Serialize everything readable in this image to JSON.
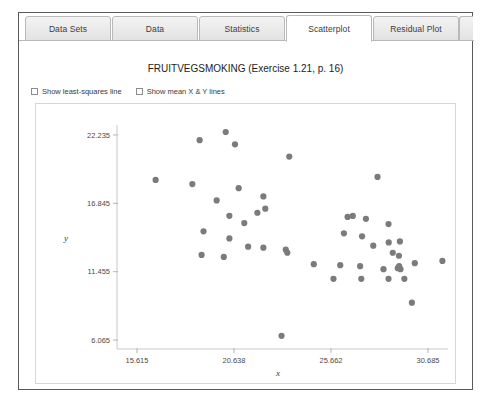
{
  "window": {
    "title": ""
  },
  "tabs": [
    {
      "label": "Data Sets",
      "active": false
    },
    {
      "label": "Data",
      "active": false
    },
    {
      "label": "Statistics",
      "active": false
    },
    {
      "label": "Scatterplot",
      "active": true
    },
    {
      "label": "Residual Plot",
      "active": false
    }
  ],
  "chart_title": "FRUITVEGSMOKING (Exercise 1.21, p. 16)",
  "options": [
    {
      "label": "Show least-squares line",
      "checked": false
    },
    {
      "label": "Show mean X & Y lines",
      "checked": false
    }
  ],
  "chart_data": {
    "type": "scatter",
    "title": "FRUITVEGSMOKING (Exercise 1.21, p. 16)",
    "xlabel": "x",
    "ylabel": "y",
    "xlim": [
      14.58,
      31.72
    ],
    "ylim": [
      5.36,
      23.02
    ],
    "xticks": [
      "15.615",
      "20.638",
      "25.662",
      "30.685"
    ],
    "yticks": [
      "22.235",
      "16.845",
      "11.455",
      "6.065"
    ],
    "xtick_values": [
      15.615,
      20.638,
      25.662,
      30.685
    ],
    "ytick_values": [
      22.235,
      16.845,
      11.455,
      6.065
    ],
    "grid": false,
    "legend": null,
    "marker_color": "#7b7b7b",
    "marker_size": 3.1,
    "points": [
      {
        "x": 16.58,
        "y": 18.69
      },
      {
        "x": 18.86,
        "y": 21.82
      },
      {
        "x": 20.21,
        "y": 22.47
      },
      {
        "x": 20.69,
        "y": 21.5
      },
      {
        "x": 23.5,
        "y": 20.53
      },
      {
        "x": 18.48,
        "y": 18.36
      },
      {
        "x": 20.88,
        "y": 18.04
      },
      {
        "x": 28.07,
        "y": 18.93
      },
      {
        "x": 19.74,
        "y": 17.07
      },
      {
        "x": 22.16,
        "y": 17.39
      },
      {
        "x": 22.26,
        "y": 16.42
      },
      {
        "x": 20.4,
        "y": 15.86
      },
      {
        "x": 21.85,
        "y": 16.1
      },
      {
        "x": 21.17,
        "y": 15.29
      },
      {
        "x": 26.52,
        "y": 15.77
      },
      {
        "x": 26.79,
        "y": 15.85
      },
      {
        "x": 27.47,
        "y": 15.62
      },
      {
        "x": 28.64,
        "y": 15.21
      },
      {
        "x": 19.06,
        "y": 14.64
      },
      {
        "x": 26.33,
        "y": 14.48
      },
      {
        "x": 27.27,
        "y": 14.24
      },
      {
        "x": 20.4,
        "y": 14.08
      },
      {
        "x": 28.65,
        "y": 13.76
      },
      {
        "x": 21.37,
        "y": 13.43
      },
      {
        "x": 22.16,
        "y": 13.35
      },
      {
        "x": 23.32,
        "y": 13.19
      },
      {
        "x": 23.4,
        "y": 12.95
      },
      {
        "x": 18.96,
        "y": 12.78
      },
      {
        "x": 20.11,
        "y": 12.62
      },
      {
        "x": 27.85,
        "y": 13.51
      },
      {
        "x": 29.23,
        "y": 13.84
      },
      {
        "x": 28.86,
        "y": 12.95
      },
      {
        "x": 29.18,
        "y": 12.71
      },
      {
        "x": 24.77,
        "y": 12.05
      },
      {
        "x": 26.14,
        "y": 11.97
      },
      {
        "x": 27.17,
        "y": 11.89
      },
      {
        "x": 28.38,
        "y": 11.65
      },
      {
        "x": 29.12,
        "y": 11.73
      },
      {
        "x": 29.26,
        "y": 11.65
      },
      {
        "x": 29.19,
        "y": 11.89
      },
      {
        "x": 31.43,
        "y": 12.3
      },
      {
        "x": 30.0,
        "y": 12.13
      },
      {
        "x": 25.79,
        "y": 10.89
      },
      {
        "x": 27.23,
        "y": 10.89
      },
      {
        "x": 28.64,
        "y": 10.89
      },
      {
        "x": 29.46,
        "y": 10.89
      },
      {
        "x": 29.85,
        "y": 9.01
      },
      {
        "x": 23.1,
        "y": 6.4
      }
    ]
  }
}
